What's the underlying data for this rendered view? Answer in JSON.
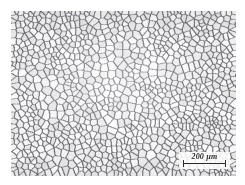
{
  "figure": {
    "kind": "optical-micrograph",
    "background_color": "#ffffff",
    "image_area": {
      "left": 11,
      "top": 11,
      "width": 225,
      "height": 165,
      "matrix_color": "#fdfdfd",
      "grain_boundary_color": "#6a6a72"
    }
  },
  "scale_bar": {
    "value": "200",
    "unit": "µm",
    "label": "200 µm",
    "bar_length_px": 43,
    "text_color": "#2b2b2b",
    "backing_color": "#ffffff"
  },
  "microstructure": {
    "seed": 20250419,
    "grain_count": 1150,
    "boundary_width_px": 1.15,
    "boundary_color": "#6a6a72",
    "boundary_color_dark": "#4a4a52",
    "grain_fill_light": "#ffffff",
    "grain_fill_dark": "#f0f0f2",
    "grain_size_note": "fine equiaxed grains, a few coarse grains"
  }
}
